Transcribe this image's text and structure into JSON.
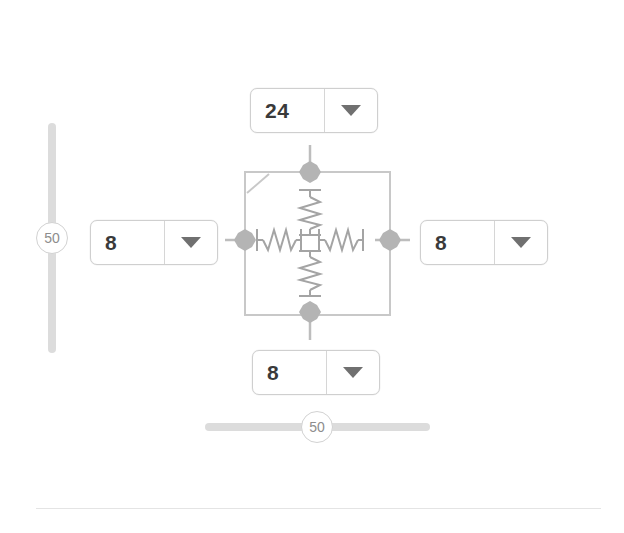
{
  "window": {
    "background_color": "#ffffff"
  },
  "spinners": {
    "top": {
      "name": "top-margin",
      "value": "24",
      "placeholder": "0",
      "arrow_icon": "chevron-down-icon"
    },
    "left": {
      "name": "left-margin",
      "value": "8",
      "placeholder": "0",
      "arrow_icon": "chevron-down-icon"
    },
    "right": {
      "name": "right-margin",
      "value": "8",
      "placeholder": "0",
      "arrow_icon": "chevron-down-icon"
    },
    "bottom": {
      "name": "bottom-margin",
      "value": "8",
      "placeholder": "0",
      "arrow_icon": "chevron-down-icon"
    }
  },
  "sliders": {
    "vertical": {
      "name": "vertical-spacing-slider",
      "value": "50",
      "min": "0",
      "max": "100",
      "orientation": "vertical"
    },
    "horizontal": {
      "name": "horizontal-spacing-slider",
      "value": "50",
      "min": "0",
      "max": "100",
      "orientation": "horizontal"
    }
  },
  "diagram": {
    "name": "spacing-spring-diagram",
    "handles": [
      "top-handle",
      "left-handle",
      "right-handle",
      "bottom-handle"
    ],
    "springs": [
      "top-spring",
      "left-spring",
      "right-spring",
      "bottom-spring"
    ],
    "corner_marker": "top-left-corner-marker",
    "colors": {
      "outline": "#c8c8c8",
      "handle": "#b4b4b4",
      "spring": "#a9a9a9",
      "connector": "#bdbdbd"
    }
  },
  "divider": {
    "name": "bottom-divider",
    "color": "#e4e4e4"
  }
}
